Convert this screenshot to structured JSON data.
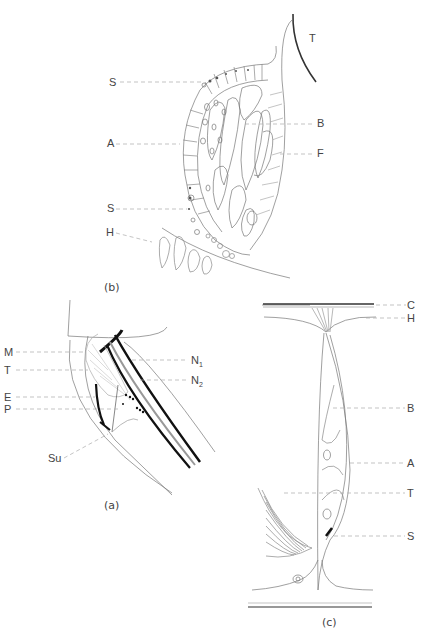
{
  "figure": {
    "panel_b": {
      "caption": "(b)",
      "labels": {
        "T": "T",
        "S_top": "S",
        "A": "A",
        "B": "B",
        "F": "F",
        "S_bottom": "S",
        "H": "H"
      }
    },
    "panel_a": {
      "caption": "(a)",
      "labels": {
        "M": "M",
        "T": "T",
        "E": "E",
        "P": "P",
        "Su": "Su",
        "N1_base": "N",
        "N1_sub": "1",
        "N2_base": "N",
        "N2_sub": "2"
      }
    },
    "panel_c": {
      "caption": "(c)",
      "labels": {
        "C": "C",
        "H": "H",
        "B": "B",
        "A": "A",
        "T": "T",
        "S": "S"
      }
    }
  }
}
